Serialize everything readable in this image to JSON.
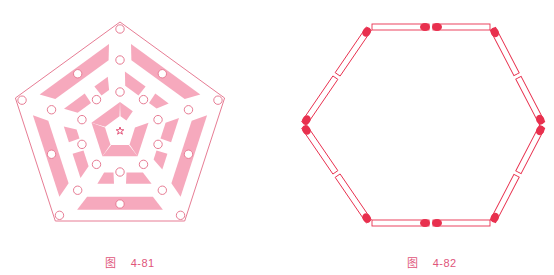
{
  "figures": [
    {
      "id": "4-81",
      "caption_prefix": "图",
      "caption_number": "4-81",
      "description": "Pentagon-shaped maze/board with concentric pink pentagonal ring segments, small circles at junctions and a star at the center",
      "elements": {
        "outer_boundary": "pentagon",
        "ring_count": 3,
        "center_marker": "star-icon",
        "circle_count": 25
      },
      "colors": {
        "stroke": "#e77c94",
        "fill": "#f6a9bd",
        "star": "#e0406a"
      }
    },
    {
      "id": "4-82",
      "caption_prefix": "图",
      "caption_number": "4-82",
      "description": "Hexagon formed by 12 matchsticks, two per side, with red match heads",
      "elements": {
        "shape": "hexagon",
        "matchstick_count": 12,
        "sticks_per_side": 2
      },
      "colors": {
        "stroke": "#e8304e",
        "head": "#e8304e"
      }
    }
  ]
}
